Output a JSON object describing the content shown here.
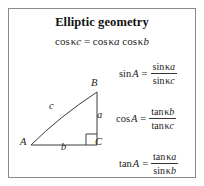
{
  "figure": {
    "title": "Elliptic geometry",
    "main_equation": {
      "lhs_fn": "cos",
      "lhs_kappa": "κ",
      "lhs_var": "c",
      "equals": "=",
      "rhs1_fn": "cos",
      "rhs1_kappa": "κ",
      "rhs1_var": "a",
      "rhs2_fn": "cos",
      "rhs2_kappa": "κ",
      "rhs2_var": "b"
    },
    "formulas": [
      {
        "id": "sine-rule",
        "lhs_fn": "sin",
        "lhs_angle": "A",
        "equals": "=",
        "numerator_fn": "sin",
        "numerator_kappa": "κ",
        "numerator_var": "a",
        "denominator_fn": "sin",
        "denominator_kappa": "κ",
        "denominator_var": "c"
      },
      {
        "id": "cosine-rule",
        "lhs_fn": "cos",
        "lhs_angle": "A",
        "equals": "=",
        "numerator_fn": "tan",
        "numerator_kappa": "κ",
        "numerator_var": "b",
        "denominator_fn": "tan",
        "denominator_kappa": "κ",
        "denominator_var": "c"
      },
      {
        "id": "tangent-rule",
        "lhs_fn": "tan",
        "lhs_angle": "A",
        "equals": "=",
        "numerator_fn": "tan",
        "numerator_kappa": "κ",
        "numerator_var": "a",
        "denominator_fn": "sin",
        "denominator_kappa": "κ",
        "denominator_var": "b"
      }
    ],
    "diagram": {
      "vertices": {
        "A": "A",
        "B": "B",
        "C": "C"
      },
      "sides": {
        "a": "a",
        "b": "b",
        "c": "c"
      }
    },
    "colors": {
      "border": "#8a8a8a",
      "stroke": "#3a3a3a",
      "text": "#1a1a1a",
      "background": "#ffffff"
    }
  }
}
